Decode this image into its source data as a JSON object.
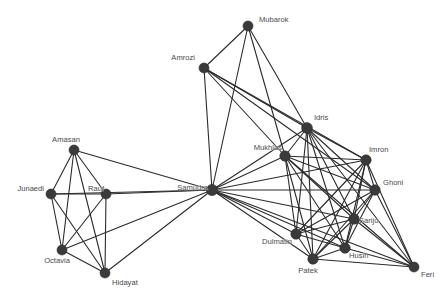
{
  "figure": {
    "type": "network-graph",
    "background_color": "#ffffff",
    "node_color": "#3a3a3a",
    "edge_color": "#2b2b2b",
    "label_color": "#4a4a4a",
    "width": 448,
    "height": 293
  },
  "chart_data": {
    "type": "scatter",
    "title": "",
    "xlabel": "",
    "ylabel": "",
    "grid": false,
    "legend": "none",
    "xlim": [
      0,
      448
    ],
    "ylim": [
      0,
      293
    ],
    "nodes": [
      {
        "id": "Mubarok",
        "label": "Mubarok",
        "x": 248,
        "y": 26,
        "r": 5.0,
        "label_x": 259,
        "label_y": 22,
        "anchor": "right"
      },
      {
        "id": "Amrozi",
        "label": "Amrozi",
        "x": 204,
        "y": 68,
        "r": 5.0,
        "label_x": 195,
        "label_y": 60,
        "anchor": "left"
      },
      {
        "id": "Idris",
        "label": "Idris",
        "x": 307,
        "y": 128,
        "r": 5.4,
        "label_x": 314,
        "label_y": 120,
        "anchor": "right"
      },
      {
        "id": "Mukhlas",
        "label": "Mukhlas",
        "x": 285,
        "y": 156,
        "r": 5.2,
        "label_x": 282,
        "label_y": 150,
        "anchor": "left"
      },
      {
        "id": "Imron",
        "label": "Imron",
        "x": 366,
        "y": 160,
        "r": 5.2,
        "label_x": 369,
        "label_y": 152,
        "anchor": "right"
      },
      {
        "id": "Ghoni",
        "label": "Ghoni",
        "x": 375,
        "y": 190,
        "r": 5.2,
        "label_x": 383,
        "label_y": 185,
        "anchor": "right"
      },
      {
        "id": "Sarijo",
        "label": "Sarijo",
        "x": 354,
        "y": 219,
        "r": 5.2,
        "label_x": 359,
        "label_y": 223,
        "anchor": "right"
      },
      {
        "id": "Husin",
        "label": "Husin",
        "x": 345,
        "y": 248,
        "r": 5.2,
        "label_x": 349,
        "label_y": 258,
        "anchor": "right"
      },
      {
        "id": "Patek",
        "label": "Patek",
        "x": 313,
        "y": 259,
        "r": 5.2,
        "label_x": 308,
        "label_y": 273,
        "anchor": "middle"
      },
      {
        "id": "Dulmatin",
        "label": "Dulmatin",
        "x": 296,
        "y": 234,
        "r": 5.2,
        "label_x": 292,
        "label_y": 244,
        "anchor": "left"
      },
      {
        "id": "Feri",
        "label": "Feri",
        "x": 414,
        "y": 267,
        "r": 5.0,
        "label_x": 421,
        "label_y": 277,
        "anchor": "right"
      },
      {
        "id": "Samudra",
        "label": "Samudra",
        "x": 212,
        "y": 190,
        "r": 5.6,
        "label_x": 208,
        "label_y": 190,
        "anchor": "left"
      },
      {
        "id": "Amasan",
        "label": "Amasan",
        "x": 74,
        "y": 150,
        "r": 5.0,
        "label_x": 66,
        "label_y": 142,
        "anchor": "middle"
      },
      {
        "id": "Junaedi",
        "label": "Junaedi",
        "x": 51,
        "y": 194,
        "r": 5.0,
        "label_x": 44,
        "label_y": 191,
        "anchor": "left"
      },
      {
        "id": "Rauf",
        "label": "Rauf",
        "x": 106,
        "y": 194,
        "r": 5.0,
        "label_x": 104,
        "label_y": 191,
        "anchor": "left"
      },
      {
        "id": "Octavia",
        "label": "Octavia",
        "x": 62,
        "y": 250,
        "r": 5.0,
        "label_x": 57,
        "label_y": 263,
        "anchor": "middle"
      },
      {
        "id": "Hidayat",
        "label": "Hidayat",
        "x": 105,
        "y": 273,
        "r": 5.0,
        "label_x": 112,
        "label_y": 285,
        "anchor": "right"
      }
    ],
    "edges": [
      [
        "Mubarok",
        "Amrozi"
      ],
      [
        "Mubarok",
        "Samudra"
      ],
      [
        "Mubarok",
        "Idris"
      ],
      [
        "Mubarok",
        "Mukhlas"
      ],
      [
        "Amrozi",
        "Samudra"
      ],
      [
        "Amrozi",
        "Idris"
      ],
      [
        "Amrozi",
        "Mukhlas"
      ],
      [
        "Amrozi",
        "Imron"
      ],
      [
        "Amrozi",
        "Ghoni"
      ],
      [
        "Samudra",
        "Idris"
      ],
      [
        "Samudra",
        "Mukhlas"
      ],
      [
        "Samudra",
        "Imron"
      ],
      [
        "Samudra",
        "Ghoni"
      ],
      [
        "Samudra",
        "Sarijo"
      ],
      [
        "Samudra",
        "Husin"
      ],
      [
        "Samudra",
        "Patek"
      ],
      [
        "Samudra",
        "Dulmatin"
      ],
      [
        "Samudra",
        "Feri"
      ],
      [
        "Samudra",
        "Amasan"
      ],
      [
        "Samudra",
        "Junaedi"
      ],
      [
        "Samudra",
        "Rauf"
      ],
      [
        "Samudra",
        "Octavia"
      ],
      [
        "Samudra",
        "Hidayat"
      ],
      [
        "Idris",
        "Mukhlas"
      ],
      [
        "Idris",
        "Imron"
      ],
      [
        "Idris",
        "Ghoni"
      ],
      [
        "Idris",
        "Sarijo"
      ],
      [
        "Idris",
        "Husin"
      ],
      [
        "Idris",
        "Patek"
      ],
      [
        "Idris",
        "Dulmatin"
      ],
      [
        "Idris",
        "Feri"
      ],
      [
        "Mukhlas",
        "Imron"
      ],
      [
        "Mukhlas",
        "Ghoni"
      ],
      [
        "Mukhlas",
        "Sarijo"
      ],
      [
        "Mukhlas",
        "Husin"
      ],
      [
        "Mukhlas",
        "Patek"
      ],
      [
        "Mukhlas",
        "Dulmatin"
      ],
      [
        "Mukhlas",
        "Feri"
      ],
      [
        "Imron",
        "Ghoni"
      ],
      [
        "Imron",
        "Sarijo"
      ],
      [
        "Imron",
        "Husin"
      ],
      [
        "Imron",
        "Patek"
      ],
      [
        "Imron",
        "Dulmatin"
      ],
      [
        "Imron",
        "Feri"
      ],
      [
        "Ghoni",
        "Sarijo"
      ],
      [
        "Ghoni",
        "Husin"
      ],
      [
        "Ghoni",
        "Patek"
      ],
      [
        "Ghoni",
        "Dulmatin"
      ],
      [
        "Ghoni",
        "Feri"
      ],
      [
        "Sarijo",
        "Husin"
      ],
      [
        "Sarijo",
        "Patek"
      ],
      [
        "Sarijo",
        "Dulmatin"
      ],
      [
        "Sarijo",
        "Feri"
      ],
      [
        "Husin",
        "Patek"
      ],
      [
        "Husin",
        "Dulmatin"
      ],
      [
        "Husin",
        "Feri"
      ],
      [
        "Patek",
        "Dulmatin"
      ],
      [
        "Patek",
        "Feri"
      ],
      [
        "Amasan",
        "Junaedi"
      ],
      [
        "Amasan",
        "Rauf"
      ],
      [
        "Amasan",
        "Octavia"
      ],
      [
        "Amasan",
        "Hidayat"
      ],
      [
        "Junaedi",
        "Rauf"
      ],
      [
        "Junaedi",
        "Octavia"
      ],
      [
        "Junaedi",
        "Hidayat"
      ],
      [
        "Rauf",
        "Octavia"
      ],
      [
        "Rauf",
        "Hidayat"
      ],
      [
        "Octavia",
        "Hidayat"
      ]
    ]
  }
}
